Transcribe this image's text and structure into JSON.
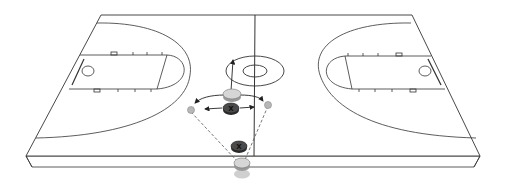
{
  "diagram": {
    "court": {
      "line_color": "#333333",
      "surface_color": "#ffffff"
    },
    "players": [
      {
        "id": "offense-top",
        "type": "offense",
        "color": "#d6d6d6"
      },
      {
        "id": "offense-bottom",
        "type": "offense",
        "color": "#d6d6d6"
      },
      {
        "id": "defender-top",
        "type": "defense",
        "label": "X",
        "color": "#4a4a4a"
      },
      {
        "id": "defender-bottom",
        "type": "defense",
        "label": "X",
        "color": "#4a4a4a"
      },
      {
        "id": "ball-left",
        "type": "ball",
        "color": "#b8b8b8"
      },
      {
        "id": "ball-right",
        "type": "ball",
        "color": "#b8b8b8"
      }
    ],
    "labels": {
      "defender_top": "X",
      "defender_bottom": "X"
    }
  }
}
